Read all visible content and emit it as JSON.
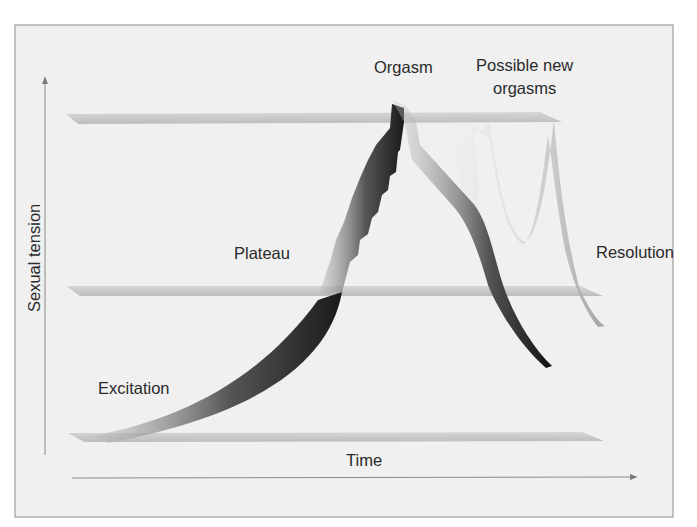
{
  "figure": {
    "y_axis_label": "Sexual tension",
    "x_axis_label": "Time",
    "phases": {
      "excitation": "Excitation",
      "plateau": "Plateau",
      "orgasm": "Orgasm",
      "new_orgasms_line1": "Possible new",
      "new_orgasms_line2": "orgasms",
      "resolution": "Resolution"
    },
    "levels": [
      "baseline",
      "plateau level",
      "orgasm level"
    ],
    "colors": {
      "background": "#f0f0f0",
      "frame": "#8a8a8a",
      "plane": "#c8c8c8",
      "main_curve": "#3a3a3a",
      "ghost_curve": "#c4c4c4",
      "text": "#2a2a2a"
    }
  }
}
